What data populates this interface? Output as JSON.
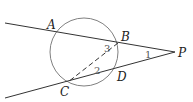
{
  "diagram": {
    "points": {
      "A": {
        "label": "A",
        "x": 56,
        "y": 32
      },
      "B": {
        "label": "B",
        "x": 118,
        "y": 43
      },
      "C": {
        "label": "C",
        "x": 68,
        "y": 82
      },
      "D": {
        "label": "D",
        "x": 115,
        "y": 70
      },
      "P": {
        "label": "P",
        "x": 175,
        "y": 52
      }
    },
    "circle": {
      "cx": 84,
      "cy": 52,
      "r": 34
    },
    "angles": {
      "a1": {
        "label": "1"
      },
      "a2": {
        "label": "2"
      },
      "a3": {
        "label": "3"
      }
    },
    "segments": [
      {
        "from": "A",
        "to": "P",
        "style": "solid"
      },
      {
        "from": "C",
        "to": "P",
        "style": "solid"
      },
      {
        "from": "B",
        "to": "C",
        "style": "dashed"
      }
    ],
    "colors": {
      "line": "#333333",
      "circle": "#777777",
      "dashed": "#333333"
    }
  }
}
